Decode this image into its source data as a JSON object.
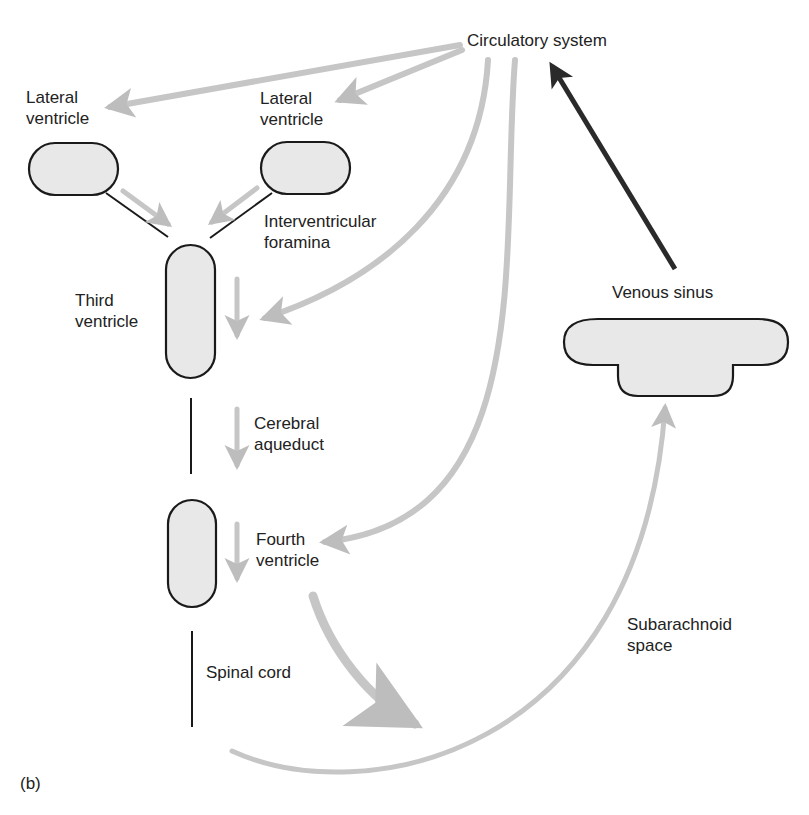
{
  "figure": {
    "panel_label": "(b)",
    "colors": {
      "flow_arrow": "#c6c6c6",
      "flow_arrow_edge": "#a9a9a9",
      "return_arrow": "#2a2a2a",
      "chamber_fill": "#e8e8e8",
      "chamber_stroke": "#1a1a1a"
    }
  },
  "labels": {
    "circulatory_system": "Circulatory system",
    "lateral_ventricle_left": "Lateral\nventricle",
    "lateral_ventricle_right": "Lateral\nventricle",
    "interventricular_foramina": "Interventricular\nforamina",
    "third_ventricle": "Third\nventricle",
    "cerebral_aqueduct": "Cerebral\naqueduct",
    "fourth_ventricle": "Fourth\nventricle",
    "spinal_cord": "Spinal cord",
    "subarachnoid_space": "Subarachnoid\nspace",
    "venous_sinus": "Venous sinus"
  },
  "flows": [
    {
      "from": "Circulatory system",
      "to": "Lateral ventricle (left)"
    },
    {
      "from": "Circulatory system",
      "to": "Lateral ventricle (right)"
    },
    {
      "from": "Lateral ventricle (left)",
      "to": "Third ventricle"
    },
    {
      "from": "Lateral ventricle (right)",
      "to": "Third ventricle"
    },
    {
      "from": "Circulatory system",
      "to": "Third ventricle"
    },
    {
      "from": "Third ventricle",
      "to": "Cerebral aqueduct"
    },
    {
      "from": "Circulatory system",
      "to": "Fourth ventricle"
    },
    {
      "from": "Fourth ventricle",
      "to": "Subarachnoid space"
    },
    {
      "from": "Subarachnoid space",
      "to": "Venous sinus"
    },
    {
      "from": "Venous sinus",
      "to": "Circulatory system"
    }
  ]
}
